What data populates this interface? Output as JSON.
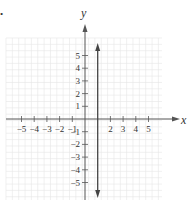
{
  "chart_data": {
    "type": "line",
    "title": "",
    "xlabel": "x",
    "ylabel": "y",
    "xlim": [
      -6,
      6
    ],
    "ylim": [
      -6,
      6
    ],
    "grid": true,
    "x_ticks": [
      -5,
      -4,
      -3,
      -2,
      -1,
      2,
      3,
      4,
      5
    ],
    "y_ticks": [
      5,
      4,
      3,
      2,
      1,
      -1,
      -2,
      -3,
      -4,
      -5
    ],
    "series": [
      {
        "name": "vertical line x = 1",
        "equation": "x = 1",
        "x": [
          1,
          1
        ],
        "y": [
          -6,
          6
        ],
        "arrows": "both"
      }
    ],
    "colors": {
      "grid": "#e6e6e6",
      "axis": "#555555",
      "line": "#444444"
    }
  },
  "marker": "•"
}
